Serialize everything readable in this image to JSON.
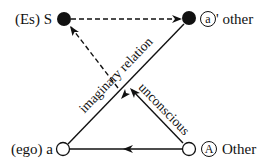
{
  "diagram": {
    "nodes": [
      {
        "id": "S",
        "prefix": "(Es)",
        "letter": "S",
        "filled": true,
        "position": "top-left"
      },
      {
        "id": "a_prime",
        "circled": "a",
        "suffix": "' other",
        "filled": true,
        "position": "top-right"
      },
      {
        "id": "a",
        "prefix": "(ego)",
        "letter": "a",
        "filled": false,
        "position": "bottom-left"
      },
      {
        "id": "A",
        "circled": "A",
        "suffix": "Other",
        "filled": false,
        "position": "bottom-right"
      }
    ],
    "edges": [
      {
        "from": "S",
        "to": "a_prime",
        "style": "dashed",
        "label": ""
      },
      {
        "from": "center",
        "to": "S",
        "style": "dashed",
        "label": ""
      },
      {
        "from": "a_prime",
        "to": "a",
        "style": "solid",
        "label": "imaginary relation"
      },
      {
        "from": "A",
        "to": "center",
        "style": "solid",
        "label": "unconscious"
      },
      {
        "from": "A",
        "to": "a",
        "style": "solid",
        "label": ""
      }
    ],
    "labels": {
      "s_prefix": "(Es) S",
      "a_prime_circled": "a",
      "a_prime_suffix": "' other",
      "a_prefix": "(ego) a",
      "A_circled": "A",
      "A_suffix": "Other",
      "imaginary": "imaginary relation",
      "unconscious": "unconscious"
    },
    "colors": {
      "ink": "#111111",
      "background": "#ffffff"
    }
  }
}
